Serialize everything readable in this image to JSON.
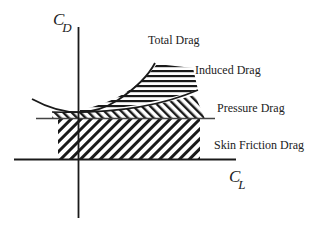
{
  "diagram": {
    "axes": {
      "y_label_main": "C",
      "y_label_sub": "D",
      "x_label_main": "C",
      "x_label_sub": "L"
    },
    "labels": {
      "total_drag": "Total Drag",
      "induced_drag": "Induced Drag",
      "pressure_drag": "Pressure Drag",
      "skin_friction_drag": "Skin Friction Drag"
    },
    "colors": {
      "ink": "#1a1a1a",
      "label": "#222222",
      "background": "#ffffff"
    }
  }
}
